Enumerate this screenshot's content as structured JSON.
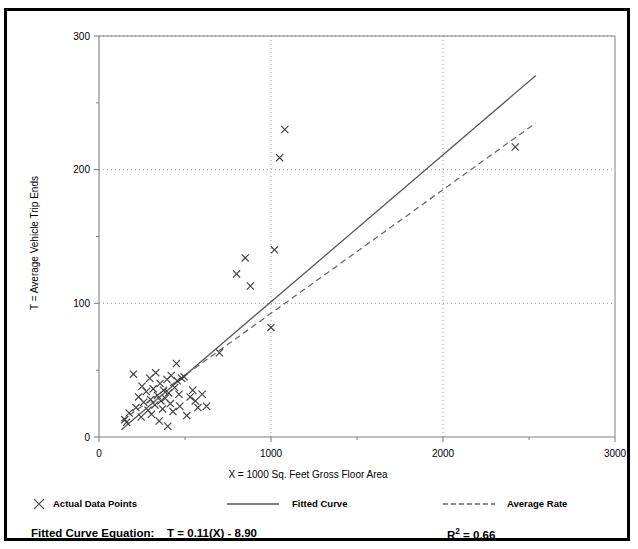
{
  "title": "",
  "axes": {
    "xlabel": "X = 1000 Sq. Feet Gross Floor Area",
    "ylabel": "T = Average Vehicle Trip Ends",
    "xticks": [
      "0",
      "1000",
      "2000",
      "3000"
    ],
    "yticks": [
      "0",
      "100",
      "200",
      "300"
    ]
  },
  "legend": {
    "data_points": "Actual Data Points",
    "fitted_curve": "Fitted Curve",
    "average_rate": "Average Rate"
  },
  "footer": {
    "equation_label": "Fitted Curve Equation:",
    "equation": "T = 0.11(X) - 8.90",
    "r2_prefix": "R",
    "r2_sup": "2",
    "r2_value": " = 0.66"
  },
  "colors": {
    "border": "#000000",
    "axis": "#808080",
    "grid": "#999999",
    "marker": "#404040",
    "fitted": "#555555",
    "average": "#666666"
  },
  "chart_data": {
    "type": "scatter",
    "title": "",
    "xlabel": "X = 1000 Sq. Feet Gross Floor Area",
    "ylabel": "T = Average Vehicle Trip Ends",
    "xlim": [
      0,
      3000
    ],
    "ylim": [
      0,
      300
    ],
    "xticks": [
      0,
      1000,
      2000,
      3000
    ],
    "yticks": [
      0,
      100,
      200,
      300
    ],
    "minor_yticks": [
      50,
      150,
      250
    ],
    "grid": true,
    "grid_style": "dotted",
    "legend_position": "below-axes",
    "series": [
      {
        "name": "Actual Data Points",
        "type": "scatter",
        "marker": "x",
        "points": [
          [
            150,
            13
          ],
          [
            160,
            11
          ],
          [
            175,
            18
          ],
          [
            200,
            47
          ],
          [
            215,
            22
          ],
          [
            230,
            30
          ],
          [
            245,
            15
          ],
          [
            250,
            38
          ],
          [
            260,
            26
          ],
          [
            275,
            34
          ],
          [
            285,
            20
          ],
          [
            295,
            44
          ],
          [
            300,
            28
          ],
          [
            305,
            17
          ],
          [
            315,
            36
          ],
          [
            325,
            24
          ],
          [
            330,
            48
          ],
          [
            340,
            31
          ],
          [
            350,
            12
          ],
          [
            355,
            40
          ],
          [
            360,
            27
          ],
          [
            370,
            21
          ],
          [
            375,
            35
          ],
          [
            385,
            29
          ],
          [
            395,
            43
          ],
          [
            400,
            8
          ],
          [
            405,
            33
          ],
          [
            415,
            25
          ],
          [
            420,
            46
          ],
          [
            430,
            19
          ],
          [
            440,
            37
          ],
          [
            450,
            55
          ],
          [
            455,
            42
          ],
          [
            465,
            32
          ],
          [
            470,
            23
          ],
          [
            480,
            44
          ],
          [
            495,
            45
          ],
          [
            510,
            16
          ],
          [
            530,
            30
          ],
          [
            545,
            35
          ],
          [
            560,
            27
          ],
          [
            575,
            22
          ],
          [
            600,
            32
          ],
          [
            625,
            23
          ],
          [
            700,
            63
          ],
          [
            800,
            122
          ],
          [
            850,
            134
          ],
          [
            880,
            113
          ],
          [
            1000,
            82
          ],
          [
            1020,
            140
          ],
          [
            1050,
            209
          ],
          [
            1080,
            230
          ],
          [
            2420,
            217
          ]
        ]
      },
      {
        "name": "Fitted Curve",
        "type": "line",
        "style": "solid",
        "equation": "T = 0.11(X) - 8.90",
        "slope": 0.11,
        "intercept": -8.9,
        "r2": 0.66,
        "x_range": [
          130,
          2540
        ]
      },
      {
        "name": "Average Rate",
        "type": "line",
        "style": "dashed",
        "slope": 0.0925,
        "intercept": 0,
        "x_range": [
          130,
          2540
        ]
      }
    ]
  }
}
